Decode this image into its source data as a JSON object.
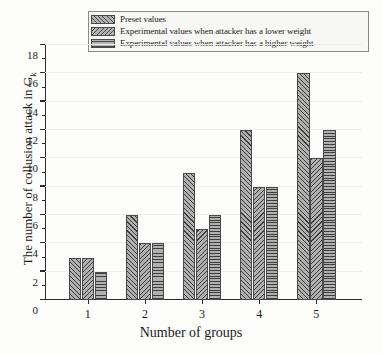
{
  "chart_data": {
    "type": "bar",
    "title": "",
    "xlabel": "Number of groups",
    "ylabel": "The number of collusion attack in G",
    "ylabel_sub": "k",
    "categories": [
      "1",
      "2",
      "3",
      "4",
      "5"
    ],
    "ylim": [
      0,
      18
    ],
    "ytick_step": 2,
    "yticks": [
      "0",
      "2",
      "4",
      "6",
      "8",
      "10",
      "12",
      "14",
      "16",
      "18"
    ],
    "minor_ticks": [
      1,
      3,
      5,
      7,
      9,
      11,
      13,
      15,
      17
    ],
    "grid": true,
    "legend_position": "top-center",
    "series": [
      {
        "name": "Preset values",
        "pattern": "diagonal-forward",
        "values": [
          3,
          6,
          9,
          12,
          16
        ]
      },
      {
        "name": "Experimental values when attacker has a lower weight",
        "pattern": "diagonal-backward",
        "values": [
          3,
          4,
          5,
          8,
          10
        ]
      },
      {
        "name": "Experimental values when attacker has a higher weight",
        "pattern": "horizontal-lines",
        "values": [
          2,
          4,
          6,
          8,
          12
        ]
      }
    ]
  },
  "colors": {
    "bar_fill": "#b0b0b0",
    "bar_edge": "#4a4a4a",
    "axis": "#2b2b2b",
    "grid": "#ededea",
    "background": "#fdfdfc",
    "legend_border": "#8a8a8a",
    "legend_background": "#f7f7f5"
  }
}
